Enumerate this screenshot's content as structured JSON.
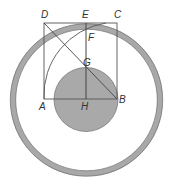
{
  "diagram": {
    "type": "geometric-construction",
    "colors": {
      "ring": "#a8a8a8",
      "ring_stroke": "#6e6e6e",
      "inner_disc": "#a9a9a9",
      "lines": "#555555",
      "labels": "#333333",
      "background": "#ffffff"
    },
    "points": {
      "A": {
        "label": "A",
        "x": 44,
        "y": 99
      },
      "B": {
        "label": "B",
        "x": 117,
        "y": 99
      },
      "C": {
        "label": "C",
        "x": 117,
        "y": 23
      },
      "D": {
        "label": "D",
        "x": 44,
        "y": 23
      },
      "E": {
        "label": "E",
        "x": 86,
        "y": 23
      },
      "F": {
        "label": "F",
        "x": 86,
        "y": 31
      },
      "G": {
        "label": "G",
        "x": 86,
        "y": 67
      },
      "H": {
        "label": "H",
        "x": 86,
        "y": 99
      }
    },
    "labels": {
      "A": "A",
      "B": "B",
      "C": "C",
      "D": "D",
      "E": "E",
      "F": "F",
      "G": "G",
      "H": "H"
    },
    "elements": [
      "outer ring (annulus) centered near H",
      "square ABCD",
      "shaded disc centered at H through G",
      "segment EH",
      "diagonal DB",
      "arc from A centered at B through F"
    ]
  }
}
